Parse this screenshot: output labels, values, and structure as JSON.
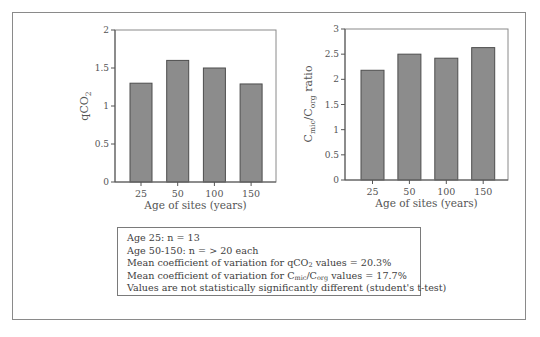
{
  "chart_data": [
    {
      "type": "bar",
      "title": "",
      "xlabel": "Age of sites (years)",
      "ylabel": "qCO2",
      "ylabel_main": "qCO",
      "ylabel_sub": "2",
      "categories": [
        "25",
        "50",
        "100",
        "150"
      ],
      "values": [
        1.3,
        1.6,
        1.5,
        1.29
      ],
      "ylim": [
        0,
        2
      ],
      "yticks": [
        "0",
        "0.5",
        "1",
        "1.5",
        "2"
      ],
      "grid": false,
      "bar_color": "#8c8c8c"
    },
    {
      "type": "bar",
      "title": "",
      "xlabel": "Age of sites (years)",
      "ylabel": "Cmic/Corg ratio",
      "ylabel_c1": "C",
      "ylabel_sub1": "mic",
      "ylabel_mid": "/C",
      "ylabel_sub2": "org",
      "ylabel_tail": " ratio",
      "categories": [
        "25",
        "50",
        "100",
        "150"
      ],
      "values": [
        2.18,
        2.5,
        2.42,
        2.63
      ],
      "ylim": [
        0,
        3
      ],
      "yticks": [
        "0",
        "0.5",
        "1",
        "1.5",
        "2",
        "2.5",
        "3"
      ],
      "grid": false,
      "bar_color": "#8c8c8c"
    }
  ],
  "legend": {
    "line1": "Age 25: n = 13",
    "line2": "Age 50-150: n = > 20 each",
    "line3_pre": "Mean coefficient of variation for qCO",
    "line3_sub": "2",
    "line3_post": " values = 20.3%",
    "line4_pre": "Mean coefficient of variation for C",
    "line4_sub1": "mic",
    "line4_mid": "/C",
    "line4_sub2": "org",
    "line4_post": " values = 17.7%",
    "line5": "Values are not statistically significantly different (student's t-test)"
  }
}
